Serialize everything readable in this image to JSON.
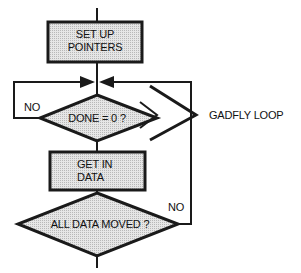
{
  "diagram": {
    "type": "flowchart",
    "nodes": {
      "setup": {
        "shape": "process",
        "line1": "SET UP",
        "line2": "POINTERS"
      },
      "done_check": {
        "shape": "decision",
        "label": "DONE = 0 ?",
        "branch_label": "NO"
      },
      "get_data": {
        "shape": "process",
        "line1": "GET IN",
        "line2": "DATA"
      },
      "moved_check": {
        "shape": "decision",
        "label": "ALL DATA MOVED ?",
        "branch_label": "NO"
      }
    },
    "annotation": {
      "label": "GADFLY LOOP"
    },
    "colors": {
      "stroke": "#1a1a1a",
      "fill": "#d8d8d8",
      "background": "#ffffff"
    }
  }
}
